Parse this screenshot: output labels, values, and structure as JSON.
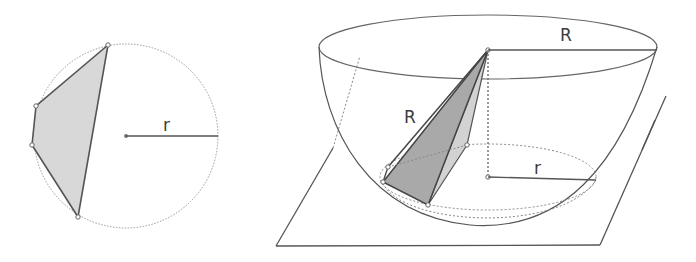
{
  "figure": {
    "left": {
      "title": "Circle with inscribed polygon (top view)",
      "radius_label": "r"
    },
    "right": {
      "title": "Hemisphere with inscribed pyramid cut by plane",
      "sphere_radius_top_label": "R",
      "sphere_radius_slant_label": "R",
      "circle_radius_label": "r"
    },
    "colors": {
      "stroke": "#555555",
      "fill_light": "#d6d6d6",
      "fill_dark": "#a8a8a8",
      "fill_side": "#cfcfcf",
      "dotted": "#888888"
    }
  }
}
